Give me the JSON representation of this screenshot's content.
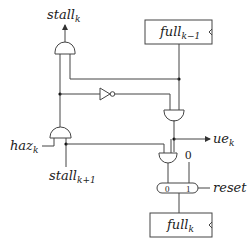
{
  "diagram": {
    "type": "circuit-schematic",
    "signals": {
      "stall_k": {
        "base": "stall",
        "sub": "k"
      },
      "haz_k": {
        "base": "haz",
        "sub": "k"
      },
      "stall_k1": {
        "base": "stall",
        "sub": "k+1"
      },
      "ue_k": {
        "base": "ue",
        "sub": "k"
      },
      "reset": {
        "base": "reset"
      }
    },
    "registers": {
      "full_prev": {
        "base": "full",
        "sub": "k−1"
      },
      "full_cur": {
        "base": "full",
        "sub": "k"
      }
    },
    "mux": {
      "input0_label": "0",
      "input1_label": "1",
      "const_input": "0"
    },
    "gates": [
      {
        "id": "and-stall",
        "type": "AND"
      },
      {
        "id": "and-haz",
        "type": "AND"
      },
      {
        "id": "inverter",
        "type": "NOT"
      },
      {
        "id": "and-ue",
        "type": "AND"
      },
      {
        "id": "and-full",
        "type": "AND"
      }
    ]
  }
}
